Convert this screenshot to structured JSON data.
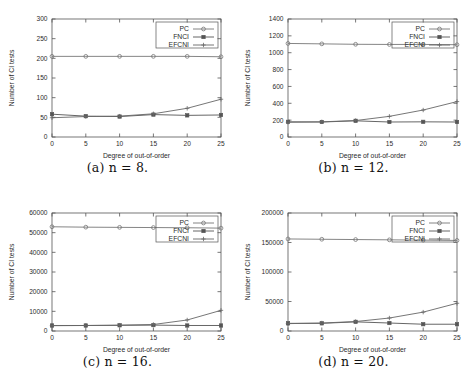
{
  "figure": {
    "background": "#ffffff",
    "axis_color": "#555555",
    "series_colors": {
      "PC": "#777777",
      "FNCI": "#555555",
      "EFCNI": "#666666"
    },
    "legend_labels": [
      "PC",
      "FNCI",
      "EFCNI"
    ],
    "legend_markers": [
      "open-circle-marker",
      "filled-square-marker",
      "plus-marker"
    ],
    "xlabel": "Degree of out-of-order",
    "ylabel": "Number of CI tests",
    "captions": {
      "a": "(a) n = 8.",
      "b": "(b) n = 12.",
      "c": "(c) n = 16.",
      "d": "(d) n = 20."
    }
  },
  "chart_data": [
    {
      "id": "panel-a",
      "type": "line",
      "title": "(a) n = 8.",
      "xlabel": "Degree of out-of-order",
      "ylabel": "Number of CI tests",
      "x": [
        0,
        5,
        10,
        15,
        20,
        25
      ],
      "xlim": [
        0,
        25
      ],
      "xticks": [
        0,
        5,
        10,
        15,
        20,
        25
      ],
      "ylim": [
        0,
        300
      ],
      "yticks": [
        0,
        50,
        100,
        150,
        200,
        250,
        300
      ],
      "grid": false,
      "legend_position": "top-right",
      "series": [
        {
          "name": "PC",
          "marker": "open-circle",
          "values": [
            205,
            205,
            205,
            205,
            205,
            204
          ]
        },
        {
          "name": "FNCI",
          "marker": "filled-square",
          "values": [
            58,
            53,
            52,
            57,
            55,
            56
          ]
        },
        {
          "name": "EFCNI",
          "marker": "plus",
          "values": [
            49,
            52,
            53,
            59,
            73,
            96
          ]
        }
      ]
    },
    {
      "id": "panel-b",
      "type": "line",
      "title": "(b) n = 12.",
      "xlabel": "Degree of out-of-order",
      "ylabel": "Number of CI tests",
      "x": [
        0,
        5,
        10,
        15,
        20,
        25
      ],
      "xlim": [
        0,
        25
      ],
      "xticks": [
        0,
        5,
        10,
        15,
        20,
        25
      ],
      "ylim": [
        0,
        1400
      ],
      "yticks": [
        0,
        200,
        400,
        600,
        800,
        1000,
        1200,
        1400
      ],
      "grid": false,
      "legend_position": "top-right",
      "series": [
        {
          "name": "PC",
          "marker": "open-circle",
          "values": [
            1110,
            1105,
            1100,
            1098,
            1098,
            1095
          ]
        },
        {
          "name": "FNCI",
          "marker": "filled-square",
          "values": [
            180,
            178,
            192,
            178,
            180,
            178
          ]
        },
        {
          "name": "EFCNI",
          "marker": "plus",
          "values": [
            175,
            180,
            195,
            245,
            320,
            420
          ]
        }
      ]
    },
    {
      "id": "panel-c",
      "type": "line",
      "title": "(c) n = 16.",
      "xlabel": "Degree of out-of-order",
      "ylabel": "Number of CI tests",
      "x": [
        0,
        5,
        10,
        15,
        20,
        25
      ],
      "xlim": [
        0,
        25
      ],
      "xticks": [
        0,
        5,
        10,
        15,
        20,
        25
      ],
      "ylim": [
        0,
        60000
      ],
      "yticks": [
        0,
        10000,
        20000,
        30000,
        40000,
        50000,
        60000
      ],
      "grid": false,
      "legend_position": "top-right",
      "series": [
        {
          "name": "PC",
          "marker": "open-circle",
          "values": [
            53000,
            52800,
            52700,
            52600,
            52500,
            52300
          ]
        },
        {
          "name": "FNCI",
          "marker": "filled-square",
          "values": [
            2800,
            2800,
            2900,
            3000,
            2800,
            2800
          ]
        },
        {
          "name": "EFCNI",
          "marker": "plus",
          "values": [
            2700,
            2800,
            2950,
            3300,
            5600,
            10500
          ]
        }
      ]
    },
    {
      "id": "panel-d",
      "type": "line",
      "title": "(d) n = 20.",
      "xlabel": "Degree of out-of-order",
      "ylabel": "Number of CI tests",
      "x": [
        0,
        5,
        10,
        15,
        20,
        25
      ],
      "xlim": [
        0,
        25
      ],
      "xticks": [
        0,
        5,
        10,
        15,
        20,
        25
      ],
      "ylim": [
        0,
        200000
      ],
      "yticks": [
        0,
        50000,
        100000,
        150000,
        200000
      ],
      "grid": false,
      "legend_position": "top-right",
      "series": [
        {
          "name": "PC",
          "marker": "open-circle",
          "values": [
            156000,
            155500,
            155000,
            154500,
            154000,
            153500
          ]
        },
        {
          "name": "FNCI",
          "marker": "filled-square",
          "values": [
            13000,
            13000,
            15500,
            13500,
            11500,
            11500
          ]
        },
        {
          "name": "EFCNI",
          "marker": "plus",
          "values": [
            12500,
            13500,
            16000,
            22000,
            32000,
            47000
          ]
        }
      ]
    }
  ]
}
